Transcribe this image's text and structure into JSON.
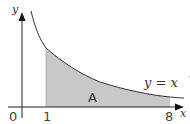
{
  "axes": {
    "x_label": "x",
    "y_label": "y",
    "origin_label": "0",
    "x_ticks": [
      "1",
      "8"
    ]
  },
  "curve": {
    "equation_lhs": "y = x",
    "exponent_sign": "−",
    "exponent_num": "1",
    "exponent_den": "3",
    "function": "y = x^(-1/3)"
  },
  "region": {
    "label": "A",
    "x_from": 1,
    "x_to": 8,
    "fill_color": "#c8c8c8"
  },
  "colors": {
    "axis": "#222222",
    "curve": "#333333",
    "shade": "#c8c8c8"
  }
}
